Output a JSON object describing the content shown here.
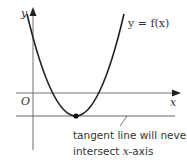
{
  "diagram": {
    "axes": {
      "x_label": "x",
      "y_label": "y",
      "origin_label": "O"
    },
    "curve": {
      "label": "y = f(x)",
      "type": "parabola",
      "vertex_marker": "point"
    },
    "tangent_line": {
      "annotation_line1": "tangent line will never",
      "annotation_line2_prefix": "intersect ",
      "annotation_line2_var": "x",
      "annotation_line2_suffix": "-axis"
    },
    "colors": {
      "axis": "#999999",
      "curve": "#222222",
      "tangent": "#555555",
      "text": "#333333"
    }
  }
}
